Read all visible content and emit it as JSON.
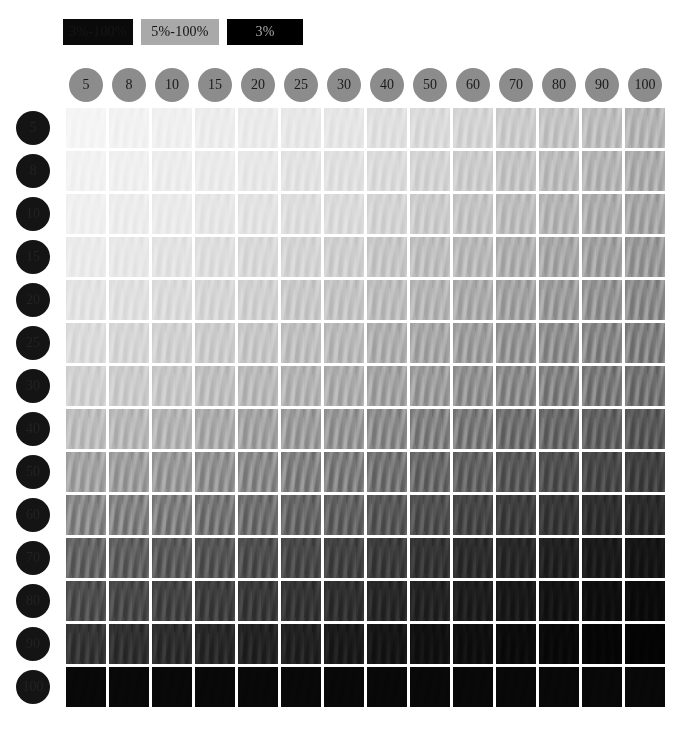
{
  "legend": {
    "items": [
      {
        "label": "3%-100%",
        "style": "dark",
        "bg": "#0a0a0a",
        "fg": "#161616"
      },
      {
        "label": "5%-100%",
        "style": "mid",
        "bg": "#a9a9a9",
        "fg": "#121212"
      },
      {
        "label": "3%",
        "style": "black",
        "bg": "#000000",
        "fg": "#a8a8a8"
      }
    ]
  },
  "chart_data": {
    "type": "heatmap",
    "title": "",
    "xlabel": "",
    "ylabel": "",
    "categories": [
      "5",
      "8",
      "10",
      "15",
      "20",
      "25",
      "30",
      "40",
      "50",
      "60",
      "70",
      "80",
      "90",
      "100"
    ],
    "rows": [
      "5",
      "8",
      "10",
      "15",
      "20",
      "25",
      "30",
      "40",
      "50",
      "60",
      "70",
      "80",
      "90",
      "100"
    ],
    "column_headers": [
      "5",
      "8",
      "10",
      "15",
      "20",
      "25",
      "30",
      "40",
      "50",
      "60",
      "70",
      "80",
      "90",
      "100"
    ],
    "row_headers": [
      "5",
      "8",
      "10",
      "15",
      "20",
      "25",
      "30",
      "40",
      "50",
      "60",
      "70",
      "80",
      "90",
      "100"
    ],
    "legend": [
      "3%-100%",
      "5%-100%",
      "3%"
    ],
    "grid": false,
    "values": [
      [
        4,
        5,
        6,
        7,
        8,
        9,
        10,
        12,
        14,
        17,
        20,
        23,
        26,
        29
      ],
      [
        5,
        6,
        7,
        8,
        9,
        11,
        12,
        14,
        17,
        20,
        23,
        26,
        29,
        32
      ],
      [
        6,
        7,
        8,
        10,
        11,
        13,
        14,
        17,
        20,
        23,
        26,
        29,
        32,
        35
      ],
      [
        8,
        9,
        11,
        13,
        15,
        17,
        19,
        22,
        25,
        28,
        31,
        34,
        37,
        40
      ],
      [
        11,
        12,
        14,
        16,
        18,
        21,
        23,
        26,
        29,
        33,
        36,
        39,
        42,
        45
      ],
      [
        14,
        16,
        18,
        20,
        22,
        25,
        27,
        31,
        34,
        38,
        41,
        44,
        47,
        50
      ],
      [
        18,
        20,
        22,
        25,
        27,
        30,
        32,
        36,
        39,
        43,
        46,
        49,
        52,
        55
      ],
      [
        26,
        28,
        30,
        33,
        36,
        39,
        41,
        45,
        49,
        52,
        56,
        59,
        62,
        65
      ],
      [
        36,
        38,
        40,
        43,
        46,
        49,
        51,
        55,
        59,
        62,
        66,
        69,
        72,
        75
      ],
      [
        47,
        49,
        51,
        54,
        57,
        60,
        62,
        66,
        69,
        73,
        76,
        79,
        82,
        84
      ],
      [
        61,
        63,
        65,
        67,
        70,
        72,
        74,
        77,
        80,
        83,
        85,
        88,
        90,
        92
      ],
      [
        70,
        72,
        74,
        76,
        78,
        80,
        82,
        85,
        87,
        89,
        91,
        93,
        95,
        96
      ],
      [
        80,
        82,
        83,
        85,
        87,
        88,
        90,
        92,
        94,
        95,
        96,
        97,
        98,
        99
      ],
      [
        100,
        100,
        100,
        100,
        100,
        100,
        100,
        100,
        100,
        100,
        100,
        100,
        100,
        100
      ]
    ]
  }
}
